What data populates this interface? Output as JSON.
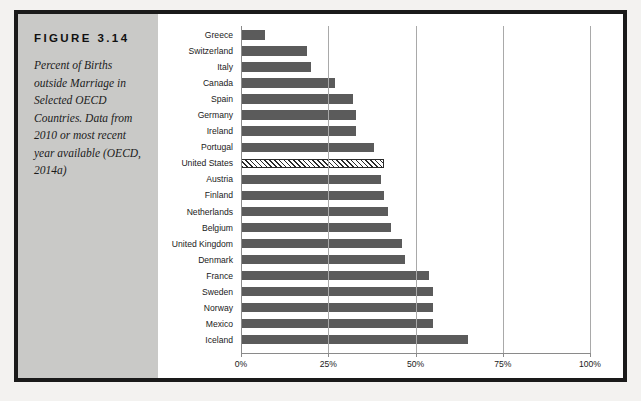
{
  "figure": {
    "number_label": "FIGURE 3.14",
    "caption": "Percent of Births outside Marriage in Selected OECD Countries. Data from 2010 or most recent year available (OECD, 2014a)"
  },
  "colors": {
    "panel_background": "#c9c9c7",
    "bar_fill": "#5b5b5b",
    "highlight_bar_outline": "#2a2a2a",
    "frame": "#1a1a1a",
    "gridline": "#a9a9a9",
    "plot_background": "#ffffff"
  },
  "chart_data": {
    "type": "bar",
    "orientation": "horizontal",
    "title": "Percent of Births outside Marriage in Selected OECD Countries",
    "xlabel": "",
    "ylabel": "",
    "xlim": [
      0,
      100
    ],
    "xticks": [
      0,
      25,
      50,
      75,
      100
    ],
    "xticklabels": [
      "0%",
      "25%",
      "50%",
      "75%",
      "100%"
    ],
    "grid": true,
    "legend": false,
    "highlighted_category": "United States",
    "highlight_style": "hatched",
    "categories": [
      "Greece",
      "Switzerland",
      "Italy",
      "Canada",
      "Spain",
      "Germany",
      "Ireland",
      "Portugal",
      "United States",
      "Austria",
      "Finland",
      "Netherlands",
      "Belgium",
      "United Kingdom",
      "Denmark",
      "France",
      "Sweden",
      "Norway",
      "Mexico",
      "Iceland"
    ],
    "values": [
      7,
      19,
      20,
      27,
      32,
      33,
      33,
      38,
      41,
      40,
      41,
      42,
      43,
      46,
      47,
      54,
      55,
      55,
      55,
      65
    ]
  }
}
